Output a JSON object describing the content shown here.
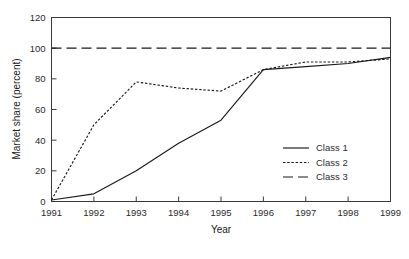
{
  "chart_data": {
    "type": "line",
    "title": "",
    "xlabel": "Year",
    "ylabel": "Market share (percent)",
    "x": [
      1991,
      1992,
      1993,
      1994,
      1995,
      1996,
      1997,
      1998,
      1999
    ],
    "xtick_labels": [
      "1991",
      "1992",
      "1993",
      "1994",
      "1995",
      "1996",
      "1997",
      "1998",
      "1999"
    ],
    "ytick_labels": [
      "0",
      "20",
      "40",
      "60",
      "80",
      "100",
      "120"
    ],
    "yticks": [
      0,
      20,
      40,
      60,
      80,
      100,
      120
    ],
    "xlim": [
      1991,
      1999
    ],
    "ylim": [
      0,
      120
    ],
    "grid": false,
    "legend_position": "lower-right-inside",
    "series": [
      {
        "name": "Class 1",
        "style": "solid",
        "values": [
          1,
          5,
          20,
          38,
          53,
          86,
          88,
          90,
          94
        ]
      },
      {
        "name": "Class 2",
        "style": "dotted",
        "values": [
          1,
          50,
          78,
          74,
          72,
          86,
          91,
          91,
          93
        ]
      },
      {
        "name": "Class 3",
        "style": "dashed",
        "values": [
          100,
          100,
          100,
          100,
          100,
          100,
          100,
          100,
          100
        ]
      }
    ]
  },
  "legend": {
    "items": [
      {
        "label": "Class 1"
      },
      {
        "label": "Class 2"
      },
      {
        "label": "Class 3"
      }
    ]
  }
}
